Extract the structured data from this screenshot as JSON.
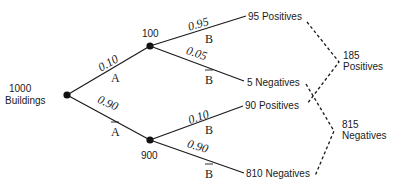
{
  "diagram": {
    "type": "probability-tree",
    "root": {
      "count": "1000",
      "label": "Buildings"
    },
    "level1": [
      {
        "count": "100",
        "probability": "0.10",
        "event": "A",
        "complement": false
      },
      {
        "count": "900",
        "probability": "0.90",
        "event": "A",
        "complement": true
      }
    ],
    "level2": [
      {
        "parent": "100",
        "probability": "0.95",
        "event": "B",
        "complement": false,
        "outcome": "95 Positives"
      },
      {
        "parent": "100",
        "probability": "0.05",
        "event": "B",
        "complement": true,
        "outcome": "5 Negatives"
      },
      {
        "parent": "900",
        "probability": "0.10",
        "event": "B",
        "complement": false,
        "outcome": "90 Positives"
      },
      {
        "parent": "900",
        "probability": "0.90",
        "event": "B",
        "complement": true,
        "outcome": "810 Negatives"
      }
    ],
    "totals": [
      {
        "count": "185",
        "label": "Positives"
      },
      {
        "count": "815",
        "label": "Negatives"
      }
    ],
    "colors": {
      "ink": "#1a1a1a",
      "background": "#ffffff"
    }
  }
}
